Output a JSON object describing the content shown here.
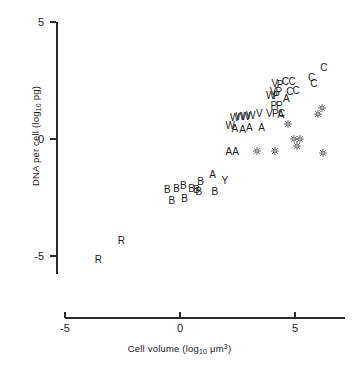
{
  "chart_data": {
    "type": "scatter",
    "title": "",
    "xlabel": "Cell volume (log10 um3)",
    "ylabel": "DNA per cell (log10 pg)",
    "xlabel_parts": {
      "pre": "Cell volume (log",
      "sub": "10",
      "mid": " μm",
      "sup": "3",
      "post": ")"
    },
    "ylabel_parts": {
      "pre": "DNA per cell (log",
      "sub": "10",
      "post": " pg)"
    },
    "xlim": [
      -5.9,
      6.9
    ],
    "ylim": [
      -6.6,
      5.4
    ],
    "xticks": [
      -5,
      0,
      5
    ],
    "xtick_labels": [
      "-5",
      "0",
      "5"
    ],
    "yticks": [
      5,
      0,
      -5
    ],
    "ytick_labels": [
      "5",
      "0",
      "-5"
    ],
    "grid": false,
    "legend": "none",
    "series": [
      {
        "name": "R",
        "marker": "letter-R",
        "points": [
          {
            "x": -2.55,
            "y": -4.35
          },
          {
            "x": -3.55,
            "y": -5.15
          }
        ]
      },
      {
        "name": "B",
        "marker": "letter-B",
        "points": [
          {
            "x": -0.55,
            "y": -2.2
          },
          {
            "x": -0.15,
            "y": -2.15
          },
          {
            "x": -0.35,
            "y": -2.65
          },
          {
            "x": 0.15,
            "y": -2.0
          },
          {
            "x": 0.2,
            "y": -2.55
          },
          {
            "x": 0.5,
            "y": -2.15
          },
          {
            "x": 0.72,
            "y": -2.2
          },
          {
            "x": 0.9,
            "y": -1.85
          },
          {
            "x": 0.82,
            "y": -2.25
          },
          {
            "x": 1.52,
            "y": -2.25
          }
        ]
      },
      {
        "name": "A",
        "marker": "letter-A",
        "points": [
          {
            "x": 1.42,
            "y": -1.55
          },
          {
            "x": 2.12,
            "y": -0.55
          },
          {
            "x": 2.42,
            "y": -0.55
          },
          {
            "x": 2.38,
            "y": 0.42
          },
          {
            "x": 2.72,
            "y": 0.4
          },
          {
            "x": 3.02,
            "y": 0.48
          },
          {
            "x": 3.55,
            "y": 0.48
          },
          {
            "x": 4.38,
            "y": 1.02
          },
          {
            "x": 4.62,
            "y": 1.7
          }
        ]
      },
      {
        "name": "Y",
        "marker": "letter-Y",
        "points": [
          {
            "x": 1.95,
            "y": -1.78
          }
        ]
      },
      {
        "name": "W",
        "marker": "letter-W",
        "points": [
          {
            "x": 2.18,
            "y": 0.55
          },
          {
            "x": 2.38,
            "y": 0.88
          },
          {
            "x": 2.62,
            "y": 0.92
          },
          {
            "x": 2.85,
            "y": 0.95
          },
          {
            "x": 3.08,
            "y": 1.0
          },
          {
            "x": 3.95,
            "y": 1.82
          }
        ]
      },
      {
        "name": "V",
        "marker": "letter-V",
        "points": [
          {
            "x": 3.45,
            "y": 1.05
          },
          {
            "x": 3.88,
            "y": 1.05
          },
          {
            "x": 4.12,
            "y": 2.35
          },
          {
            "x": 4.05,
            "y": 2.02
          }
        ]
      },
      {
        "name": "P",
        "marker": "letter-P",
        "points": [
          {
            "x": 4.08,
            "y": 1.42
          },
          {
            "x": 4.32,
            "y": 1.42
          },
          {
            "x": 4.2,
            "y": 1.82
          },
          {
            "x": 4.35,
            "y": 2.32
          },
          {
            "x": 4.3,
            "y": 2.02
          },
          {
            "x": 4.15,
            "y": 1.05
          }
        ]
      },
      {
        "name": "C",
        "marker": "letter-C",
        "points": [
          {
            "x": 4.58,
            "y": 2.45
          },
          {
            "x": 4.88,
            "y": 2.45
          },
          {
            "x": 4.78,
            "y": 2.02
          },
          {
            "x": 5.05,
            "y": 2.05
          },
          {
            "x": 5.72,
            "y": 2.62
          },
          {
            "x": 5.82,
            "y": 2.35
          },
          {
            "x": 6.25,
            "y": 3.05
          },
          {
            "x": 4.42,
            "y": 1.05
          }
        ]
      },
      {
        "name": "starburst",
        "marker": "starburst",
        "points": [
          {
            "x": 3.35,
            "y": -0.5
          },
          {
            "x": 4.12,
            "y": -0.52
          },
          {
            "x": 4.68,
            "y": 0.62
          },
          {
            "x": 4.95,
            "y": 0.0
          },
          {
            "x": 5.22,
            "y": 0.02
          },
          {
            "x": 5.08,
            "y": -0.32
          },
          {
            "x": 5.98,
            "y": 1.08
          },
          {
            "x": 6.18,
            "y": 1.32
          },
          {
            "x": 6.2,
            "y": -0.58
          }
        ]
      }
    ]
  }
}
